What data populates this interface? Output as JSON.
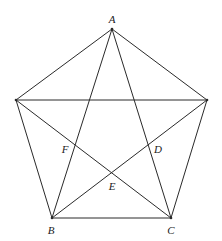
{
  "diagram": {
    "stroke_color": "#2a2a2a",
    "vertices": {
      "A": {
        "x": 112,
        "y": 29
      },
      "L": {
        "x": 16,
        "y": 100
      },
      "R": {
        "x": 207,
        "y": 100
      },
      "B": {
        "x": 52,
        "y": 218
      },
      "C": {
        "x": 171,
        "y": 218
      }
    },
    "edges": [
      [
        "A",
        "L"
      ],
      [
        "A",
        "R"
      ],
      [
        "L",
        "B"
      ],
      [
        "R",
        "C"
      ],
      [
        "B",
        "C"
      ],
      [
        "A",
        "B"
      ],
      [
        "A",
        "C"
      ],
      [
        "L",
        "R"
      ],
      [
        "L",
        "C"
      ],
      [
        "R",
        "B"
      ]
    ],
    "labels": [
      {
        "id": "A",
        "text": "A",
        "x": 112,
        "y": 19
      },
      {
        "id": "F",
        "text": "F",
        "x": 65,
        "y": 149
      },
      {
        "id": "D",
        "text": "D",
        "x": 158,
        "y": 149
      },
      {
        "id": "E",
        "text": "E",
        "x": 112,
        "y": 186
      },
      {
        "id": "B",
        "text": "B",
        "x": 51,
        "y": 230
      },
      {
        "id": "C",
        "text": "C",
        "x": 171,
        "y": 230
      }
    ],
    "points": {
      "F": {
        "x": 74,
        "y": 145
      },
      "D": {
        "x": 148,
        "y": 145
      },
      "E": {
        "x": 112,
        "y": 173
      }
    }
  }
}
